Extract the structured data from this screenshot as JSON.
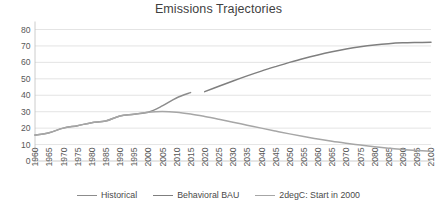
{
  "chart_data": {
    "type": "line",
    "title": "Emissions Trajectories",
    "xlabel": "",
    "ylabel": "",
    "xlim": [
      1960,
      2100
    ],
    "ylim": [
      0,
      80
    ],
    "ytick_step": 10,
    "xtick_step": 5,
    "grid": true,
    "legend_position": "bottom",
    "yticks": [
      "0",
      "10",
      "20",
      "30",
      "40",
      "50",
      "60",
      "70",
      "80"
    ],
    "xticks": [
      "1960",
      "1965",
      "1970",
      "1975",
      "1980",
      "1985",
      "1990",
      "1995",
      "2000",
      "2005",
      "2010",
      "2015",
      "2020",
      "2025",
      "2030",
      "2035",
      "2040",
      "2045",
      "2050",
      "2055",
      "2060",
      "2065",
      "2070",
      "2075",
      "2080",
      "2085",
      "2090",
      "2095",
      "2100"
    ],
    "series": [
      {
        "name": "Historical",
        "color": "#8c8c8c",
        "x": [
          1960,
          1965,
          1970,
          1975,
          1980,
          1985,
          1990,
          1995,
          2000,
          2005,
          2010,
          2015
        ],
        "values": [
          15.8,
          17.2,
          20.0,
          21.5,
          23.3,
          24.3,
          27.4,
          28.5,
          29.7,
          33.5,
          38.3,
          41.6
        ]
      },
      {
        "name": "Behavioral BAU",
        "color": "#7f7f7f",
        "x": [
          2020,
          2025,
          2030,
          2035,
          2040,
          2045,
          2050,
          2055,
          2060,
          2065,
          2070,
          2075,
          2080,
          2085,
          2090,
          2095,
          2100
        ],
        "values": [
          42.2,
          45.5,
          48.7,
          51.8,
          54.7,
          57.4,
          60.0,
          62.4,
          64.5,
          66.4,
          68.1,
          69.5,
          70.6,
          71.4,
          71.9,
          72.1,
          72.2
        ]
      },
      {
        "name": "2degC: Start in 2000",
        "color": "#a6a6a6",
        "x": [
          1960,
          1965,
          1970,
          1975,
          1980,
          1985,
          1990,
          1995,
          2000,
          2005,
          2010,
          2015,
          2020,
          2025,
          2030,
          2035,
          2040,
          2045,
          2050,
          2055,
          2060,
          2065,
          2070,
          2075,
          2080,
          2085,
          2090,
          2095,
          2100
        ],
        "values": [
          15.8,
          17.2,
          20.0,
          21.5,
          23.3,
          24.3,
          27.4,
          28.5,
          29.7,
          30.1,
          29.7,
          28.6,
          27.1,
          25.4,
          23.6,
          21.8,
          20.0,
          18.2,
          16.5,
          14.9,
          13.4,
          12.0,
          10.8,
          9.7,
          8.7,
          7.8,
          7.0,
          6.4,
          5.9
        ]
      }
    ]
  },
  "legend": {
    "items": [
      {
        "label": "Historical",
        "color": "#8c8c8c"
      },
      {
        "label": "Behavioral BAU",
        "color": "#7f7f7f"
      },
      {
        "label": "2degC: Start in 2000",
        "color": "#a6a6a6"
      }
    ]
  }
}
